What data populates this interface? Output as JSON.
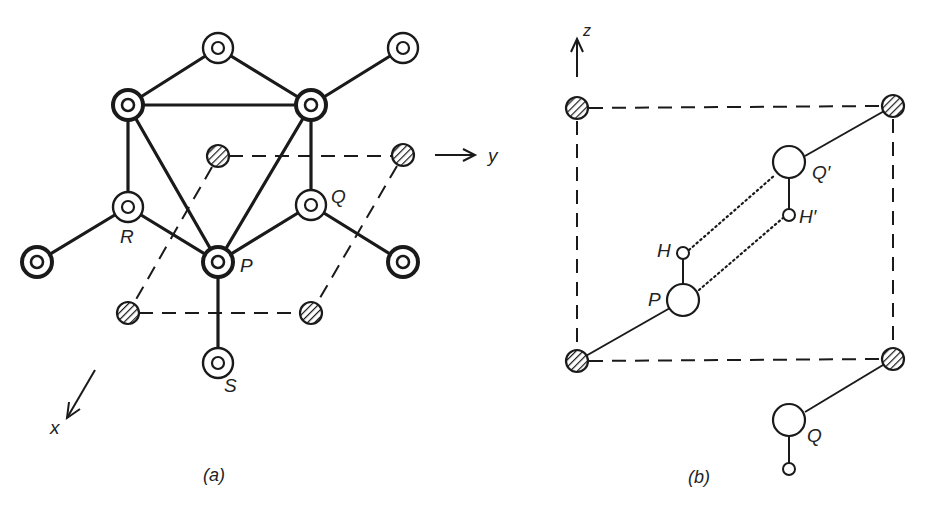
{
  "figure": {
    "panel_a": {
      "caption": "(a)",
      "axis_x_label": "x",
      "axis_y_label": "y",
      "atom_labels": {
        "P": "P",
        "Q": "Q",
        "R": "R",
        "S": "S"
      }
    },
    "panel_b": {
      "caption": "(b)",
      "axis_z_label": "z",
      "atom_labels": {
        "P": "P",
        "H": "H",
        "Q_prime": "Q′",
        "H_prime": "H′",
        "Q": "Q"
      }
    },
    "colors": {
      "ink": "#1a1a1a",
      "background": "#ffffff"
    }
  }
}
